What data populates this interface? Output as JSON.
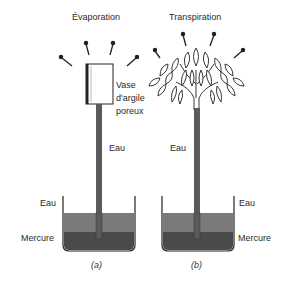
{
  "figure": {
    "panel_a": {
      "title": "Évaporation",
      "vase_label_line1": "Vase",
      "vase_label_line2": "d'argile",
      "vase_label_line3": "poreux",
      "tube_label": "Eau",
      "water_label": "Eau",
      "mercury_label": "Mercure",
      "caption": "(a)"
    },
    "panel_b": {
      "title": "Transpiration",
      "tube_label": "Eau",
      "water_label": "Eau",
      "mercury_label": "Mercure",
      "caption": "(b)"
    },
    "colors": {
      "water": "#6e6e6e",
      "mercury": "#4a4a4a",
      "tube": "#5a5a5a",
      "outline": "#222222"
    }
  }
}
